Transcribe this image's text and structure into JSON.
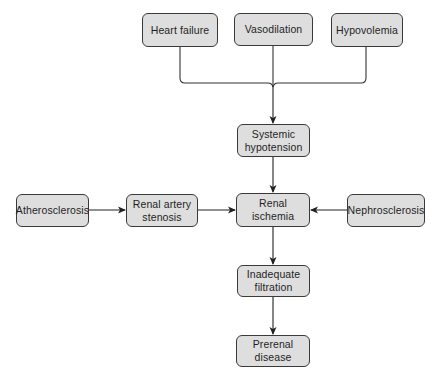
{
  "diagram": {
    "type": "flowchart",
    "colors": {
      "node_fill": "#dedede",
      "node_border": "#3a3a3a",
      "text": "#1e1e1e",
      "arrow": "#222222",
      "background": "#ffffff"
    },
    "nodes": {
      "heart_failure": {
        "label": "Heart failure"
      },
      "vasodilation": {
        "label": "Vasodilation"
      },
      "hypovolemia": {
        "label": "Hypovolemia"
      },
      "systemic_hypotension": {
        "line1": "Systemic",
        "line2": "hypotension"
      },
      "atherosclerosis": {
        "label": "Atherosclerosis"
      },
      "renal_artery_stenosis": {
        "line1": "Renal artery",
        "line2": "stenosis"
      },
      "renal_ischemia": {
        "line1": "Renal",
        "line2": "ischemia"
      },
      "nephrosclerosis": {
        "label": "Nephrosclerosis"
      },
      "inadequate_filtration": {
        "line1": "Inadequate",
        "line2": "filtration"
      },
      "prerenal_disease": {
        "line1": "Prerenal",
        "line2": "disease"
      }
    },
    "edges": [
      {
        "from": "Heart failure",
        "to": "Systemic hypotension"
      },
      {
        "from": "Vasodilation",
        "to": "Systemic hypotension"
      },
      {
        "from": "Hypovolemia",
        "to": "Systemic hypotension"
      },
      {
        "from": "Systemic hypotension",
        "to": "Renal ischemia"
      },
      {
        "from": "Atherosclerosis",
        "to": "Renal artery stenosis"
      },
      {
        "from": "Renal artery stenosis",
        "to": "Renal ischemia"
      },
      {
        "from": "Nephrosclerosis",
        "to": "Renal ischemia"
      },
      {
        "from": "Renal ischemia",
        "to": "Inadequate filtration"
      },
      {
        "from": "Inadequate filtration",
        "to": "Prerenal disease"
      }
    ]
  }
}
